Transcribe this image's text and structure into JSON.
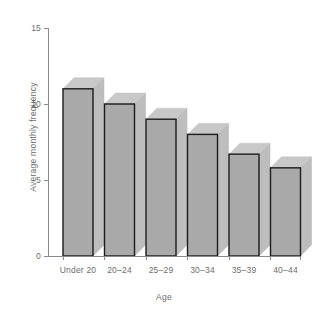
{
  "chart_data": {
    "type": "bar",
    "title": "",
    "subtitle": "",
    "xlabel": "Age",
    "ylabel": "Average monthly frequency",
    "categories": [
      "Under 20",
      "20–24",
      "25–29",
      "30–34",
      "35–39",
      "40–44"
    ],
    "values": [
      11,
      10,
      9,
      8,
      6.7,
      5.8
    ],
    "series": [
      {
        "name": "Average monthly frequency",
        "values": [
          11,
          10,
          9,
          8,
          6.7,
          5.8
        ]
      }
    ],
    "ylim": [
      0,
      15
    ],
    "yticks": [
      0,
      5,
      10,
      15
    ],
    "ytick_labels": [
      "0",
      "5",
      "10",
      "15"
    ],
    "xlim_categories": 6,
    "grid": false,
    "legend": false,
    "legend_position": "none",
    "style": "3d-extruded-bars",
    "colors": {
      "bar_front": "#a9a9a9",
      "bar_top": "#c8c8c8",
      "bar_side": "#bdbdbd",
      "bar_outline": "#1c1c1c",
      "axis": "#8a8a8a",
      "text": "#6d6d6d",
      "background": "#ffffff"
    }
  }
}
